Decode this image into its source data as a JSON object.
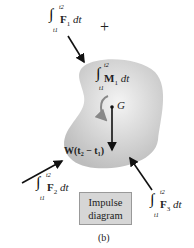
{
  "diagram": {
    "plus_sign": "+",
    "labels": {
      "F1": {
        "integral": "∫",
        "upper": "t2",
        "lower": "t1",
        "body": "F",
        "sub": "1",
        "tail": " dt"
      },
      "M1": {
        "integral": "∫",
        "upper": "t2",
        "lower": "t1",
        "body": "M",
        "sub": "1",
        "tail": " dt"
      },
      "F2": {
        "integral": "∫",
        "upper": "t2",
        "lower": "t1",
        "body": "F",
        "sub": "2",
        "tail": " dt"
      },
      "F3": {
        "integral": "∫",
        "upper": "t2",
        "lower": "t1",
        "body": "F",
        "sub": "3",
        "tail": " dt"
      },
      "G": "G",
      "W": "W(t₂ − t₁)"
    },
    "box": {
      "line1": "Impulse",
      "line2": "diagram"
    },
    "caption": "(b)",
    "colors": {
      "body_fill": "#cfcfcf",
      "box_fill": "#d6d6d6",
      "arrow": "#111111"
    }
  }
}
